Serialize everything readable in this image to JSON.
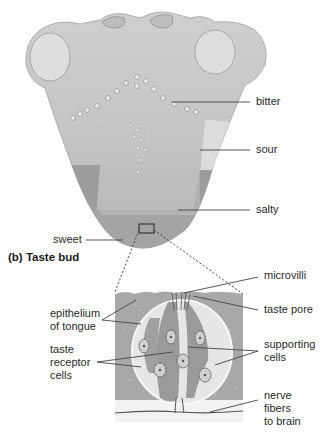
{
  "diagram": {
    "tongue": {
      "labels": {
        "bitter": "bitter",
        "sour": "sour",
        "salty": "salty",
        "sweet": "sweet"
      }
    },
    "taste_bud": {
      "title": "(b)  Taste bud",
      "labels": {
        "microvilli": "microvilli",
        "taste_pore": "taste pore",
        "epithelium": "epithelium\nof tongue",
        "taste_receptor_cells": "taste\nreceptor\ncells",
        "supporting_cells": "supporting\ncells",
        "nerve_fibers": "nerve\nfibers\nto brain"
      }
    },
    "colors": {
      "tongue_light": "#d6d6d6",
      "tongue_mid": "#bcbcbc",
      "tongue_dark": "#9a9a9a",
      "epithelium": "#a6a6a6",
      "bud_light": "#e4e4e4",
      "cell": "#8a8a8a",
      "leader_line": "#444444"
    }
  }
}
